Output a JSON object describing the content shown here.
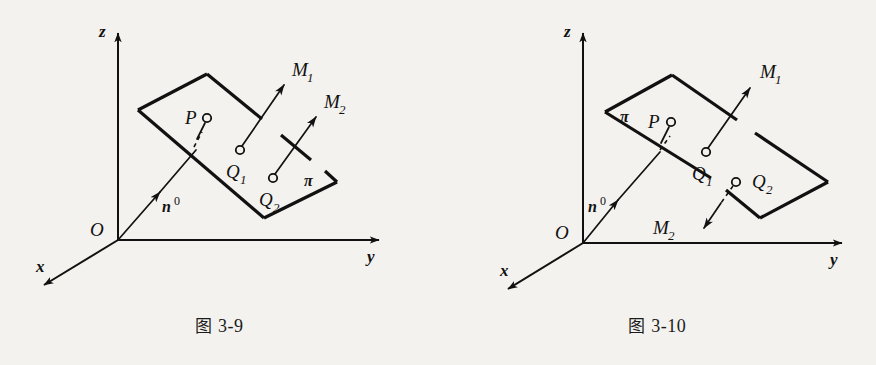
{
  "page": {
    "background_color": "#f4f2ee",
    "ink_color": "#111111",
    "width": 876,
    "height": 365
  },
  "figures": [
    {
      "id": "figure-3-9",
      "caption_cn": "图",
      "caption_number": "3-9",
      "caption_full": "图 3-9",
      "axes": {
        "z_label": "z",
        "y_label": "y",
        "x_label": "x",
        "origin_label": "O"
      },
      "normal_vector": {
        "label": "n",
        "superscript": "0",
        "label_full": "n0"
      },
      "plane": {
        "label": "π",
        "label_name": "pi"
      },
      "points": [
        {
          "name": "P",
          "label": "P",
          "subscript": ""
        },
        {
          "name": "Q1",
          "label": "Q",
          "subscript": "1"
        },
        {
          "name": "Q2",
          "label": "Q",
          "subscript": "2"
        }
      ],
      "vectors": [
        {
          "name": "M1",
          "label": "M",
          "subscript": "1",
          "direction": "up-right",
          "from": "Q1"
        },
        {
          "name": "M2",
          "label": "M",
          "subscript": "2",
          "direction": "up-right",
          "from": "Q2"
        }
      ]
    },
    {
      "id": "figure-3-10",
      "caption_cn": "图",
      "caption_number": "3-10",
      "caption_full": "图 3-10",
      "axes": {
        "z_label": "z",
        "y_label": "y",
        "x_label": "x",
        "origin_label": "O"
      },
      "normal_vector": {
        "label": "n",
        "superscript": "0",
        "label_full": "n0"
      },
      "plane": {
        "label": "π",
        "label_name": "pi"
      },
      "points": [
        {
          "name": "P",
          "label": "P",
          "subscript": ""
        },
        {
          "name": "Q1",
          "label": "Q",
          "subscript": "1"
        },
        {
          "name": "Q2",
          "label": "Q",
          "subscript": "2"
        }
      ],
      "vectors": [
        {
          "name": "M1",
          "label": "M",
          "subscript": "1",
          "direction": "up-right",
          "from": "Q1"
        },
        {
          "name": "M2",
          "label": "M",
          "subscript": "2",
          "direction": "down-left",
          "from": "Q2"
        }
      ]
    }
  ]
}
